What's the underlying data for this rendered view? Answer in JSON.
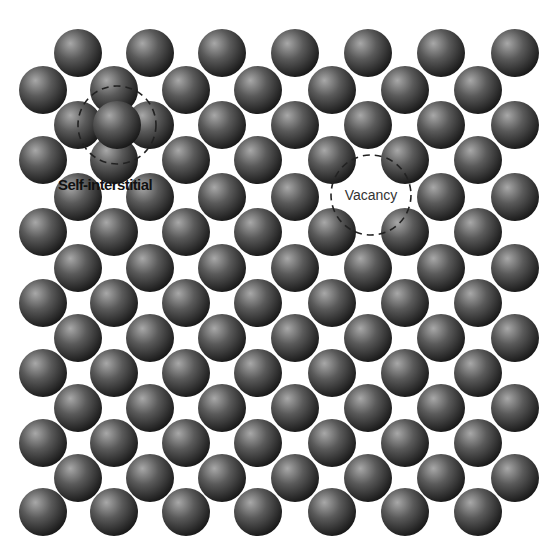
{
  "diagram": {
    "background": "#ffffff",
    "sphere": {
      "radius": 24,
      "highlight_color": "#a8a8a8",
      "mid_color": "#5a5a5a",
      "edge_color": "#161616"
    },
    "lattice": {
      "odd_row_x": [
        43,
        114,
        186,
        258,
        332,
        405,
        478
      ],
      "even_row_x": [
        78,
        150,
        222,
        295,
        368,
        441,
        515
      ],
      "rows": [
        {
          "y": 53,
          "type": "even"
        },
        {
          "y": 90,
          "type": "odd"
        },
        {
          "y": 125,
          "type": "even"
        },
        {
          "y": 160,
          "type": "odd"
        },
        {
          "y": 197,
          "type": "even"
        },
        {
          "y": 232,
          "type": "odd"
        },
        {
          "y": 268,
          "type": "even"
        },
        {
          "y": 303,
          "type": "odd"
        },
        {
          "y": 338,
          "type": "even"
        },
        {
          "y": 373,
          "type": "odd"
        },
        {
          "y": 408,
          "type": "even"
        },
        {
          "y": 443,
          "type": "odd"
        },
        {
          "y": 478,
          "type": "even"
        },
        {
          "y": 512,
          "type": "odd"
        }
      ],
      "missing_sites": [
        {
          "row": 4,
          "x": 368
        }
      ]
    },
    "defects": [
      {
        "id": "self-interstitial",
        "label": "Self-interstitial",
        "atom": {
          "x": 117,
          "y": 125
        },
        "ring": {
          "cx": 117,
          "cy": 125,
          "r": 39
        },
        "label_pos": {
          "x": 58,
          "y": 190
        }
      },
      {
        "id": "vacancy",
        "label": "Vacancy",
        "ring": {
          "cx": 371,
          "cy": 195,
          "r": 40
        },
        "label_pos": {
          "x": 371,
          "y": 200
        }
      }
    ]
  }
}
